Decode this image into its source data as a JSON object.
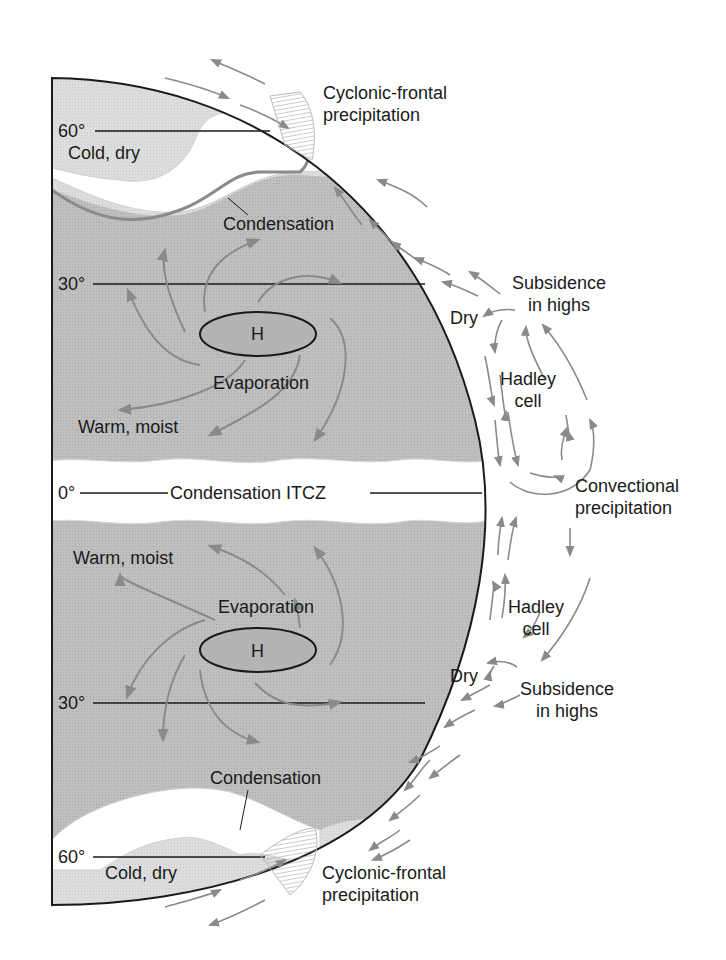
{
  "diagram": {
    "colors": {
      "ocean_fill": "#bdbdbd",
      "polar_fill": "#dcdcdc",
      "cloud_fill": "#ffffff",
      "outline": "#1a1a1a",
      "arrow": "#8a8a8a",
      "front_line": "#8a8a8a"
    },
    "latitudes": {
      "north_60": "60°",
      "north_30": "30°",
      "equator": "0°",
      "south_30": "30°",
      "south_60": "60°"
    },
    "labels": {
      "north_cold_dry": "Cold, dry",
      "north_condensation": "Condensation",
      "north_high": "H",
      "north_evaporation": "Evaporation",
      "north_warm_moist": "Warm, moist",
      "itcz": "Condensation ITCZ",
      "south_warm_moist": "Warm, moist",
      "south_evaporation": "Evaporation",
      "south_high": "H",
      "south_condensation": "Condensation",
      "south_cold_dry": "Cold, dry",
      "north_cyclonic_1": "Cyclonic-frontal",
      "north_cyclonic_2": "precipitation",
      "north_subsidence_1": "Subsidence",
      "north_subsidence_2": "in highs",
      "north_dry": "Dry",
      "north_hadley_1": "Hadley",
      "north_hadley_2": "cell",
      "convectional_1": "Convectional",
      "convectional_2": "precipitation",
      "south_hadley_1": "Hadley",
      "south_hadley_2": "cell",
      "south_dry": "Dry",
      "south_subsidence_1": "Subsidence",
      "south_subsidence_2": "in highs",
      "south_cyclonic_1": "Cyclonic-frontal",
      "south_cyclonic_2": "precipitation"
    }
  }
}
